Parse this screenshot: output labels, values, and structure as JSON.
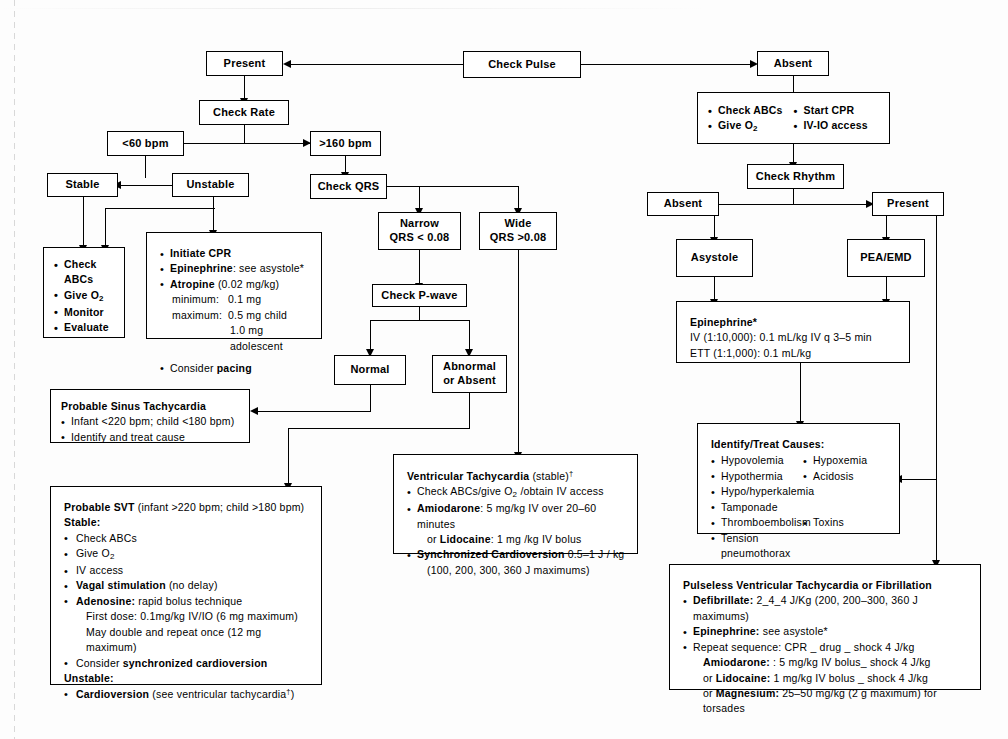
{
  "diagram": {
    "nodes": {
      "check_pulse": "Check  Pulse",
      "present": "Present",
      "absent": "Absent",
      "check_rate": "Check Rate",
      "bpm_low": "<60 bpm",
      "bpm_high": ">160  bpm",
      "stable": "Stable",
      "unstable": "Unstable",
      "check_qrs": "Check  QRS",
      "narrow_l1": "Narrow",
      "narrow_l2": "QRS  < 0.08",
      "wide_l1": "Wide",
      "wide_l2": "QRS  >0.08",
      "check_pwave": "Check P-wave",
      "normal": "Normal",
      "abnormal_l1": "Abnormal",
      "abnormal_l2": "or Absent",
      "check_rhythm": "Check   Rhythm",
      "rhythm_absent": "Absent",
      "rhythm_present": "Present",
      "asystole": "Asystole",
      "pea_emd": "PEA/EMD"
    },
    "abc_box": {
      "col_a": [
        "Check ABCs",
        "Give O2",
        "Monitor",
        "Evaluate"
      ]
    },
    "arrest_abc_box": {
      "col_a": [
        "Check ABCs",
        "Give O2"
      ],
      "col_b": [
        "Start CPR",
        "IV-IO access"
      ]
    },
    "bradycardia_box": {
      "items": [
        {
          "bold": "Initiate CPR",
          "rest": ""
        },
        {
          "bold": "Epinephrine",
          "rest": ": see asystole*"
        },
        {
          "bold": "Atropine",
          "rest": " (0.02 mg/kg)"
        }
      ],
      "minimum_label": "minimum:",
      "minimum_value": "0.1 mg",
      "maximum_label": "maximum:",
      "maximum_value": "0.5 mg child",
      "maximum_value2": "1.0 mg adolescent",
      "consider_prefix": "Consider ",
      "consider_bold": "pacing"
    },
    "sinus_tach_box": {
      "title": "Probable Sinus Tachycardia",
      "lines": [
        "Infant <220 bpm; child <180 bpm)",
        "Identify and treat cause"
      ]
    },
    "svt_box": {
      "title_bold": "Probable SVT",
      "title_rest": " (infant >220 bpm; child >180 bpm)",
      "stable_label": "Stable:",
      "stable_items": [
        {
          "bold": "",
          "rest": "Check ABCs"
        },
        {
          "bold": "",
          "rest": "Give O2"
        },
        {
          "bold": "",
          "rest": "IV access"
        },
        {
          "bold": "Vagal stimulation",
          "rest": " (no delay)"
        },
        {
          "bold": "Adenosine:",
          "rest": " rapid bolus technique"
        }
      ],
      "adenosine_sub1": "First dose: 0.1mg/kg IV/IO (6 mg maximum)",
      "adenosine_sub2": "May double and repeat once (12 mg maximum)",
      "consider_prefix": "Consider ",
      "consider_bold": "synchronized cardioversion",
      "unstable_label": "Unstable:",
      "unstable_bold": "Cardioversion",
      "unstable_rest": " (see ventricular tachycardia",
      "unstable_sup": "†",
      "unstable_tail": ")"
    },
    "vtach_box": {
      "title_bold": "Ventricular Tachycardia",
      "title_rest": " (stable)",
      "title_sup": "†",
      "line1": "Check ABCs/give O2 /obtain IV access",
      "line2_bold": "Amiodarone",
      "line2_rest": ": 5 mg/kg IV over 20–60 minutes",
      "line3_prefix": "or ",
      "line3_bold": "Lidocaine",
      "line3_rest": ": 1 mg /kg IV bolus",
      "line4_bold": "Synchronized Cardioversion",
      "line4_rest": " 0.5–1 J / kg",
      "line5": "(100, 200, 300, 360 J maximums)"
    },
    "epinephrine_box": {
      "title": "Epinephrine*",
      "line1": "IV (1:10,000):  0.1 mL/kg IV q 3–5 min",
      "line2": "ETT (1:1,000): 0.1 mL/kg"
    },
    "causes_box": {
      "title": "Identify/Treat Causes:",
      "col_a": [
        "Hypovolemia",
        "Hypothermia",
        "Hypo/hyperkalemia",
        "Tamponade",
        "Thromboembolism",
        "Tension pneumothorax"
      ],
      "col_b": [
        "Hypoxemia",
        "Acidosis",
        "",
        "",
        "Toxins",
        ""
      ]
    },
    "pulseless_box": {
      "title": "Pulseless Ventricular Tachycardia or Fibrillation",
      "line1_bold": "Defibrillate:",
      "line1_rest": " 2_4_4 J/Kg (200, 200–300, 360 J maximums)",
      "line2_bold": "Epinephrine:",
      "line2_rest": " see asystole*",
      "line3": "Repeat sequence: CPR _ drug _ shock 4 J/kg",
      "line4_bold": "Amiodarone:",
      "line4_rest": " : 5 mg/kg IV bolus_ shock 4 J/kg",
      "line5_prefix": "or ",
      "line5_bold": "Lidocaine:",
      "line5_rest": " 1 mg/kg IV bolus _ shock 4 J/kg",
      "line6_prefix": "or ",
      "line6_bold": "Magnesium:",
      "line6_rest": " 25–50 mg/kg (2 g maximum) for torsades"
    }
  },
  "colors": {
    "stroke": "#000000",
    "background": "#ffffff"
  }
}
